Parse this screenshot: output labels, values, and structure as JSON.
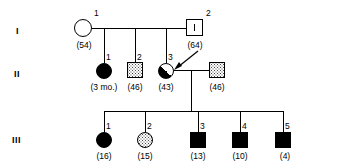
{
  "figure": {
    "type": "pedigree-chart",
    "title": "",
    "generation_labels": [
      "I",
      "II",
      "III"
    ],
    "symbol_colors": {
      "stroke": "#000000",
      "affected_fill": "#000000",
      "unaffected_fill": "#ffffff",
      "carrier_fill": "#4a4a4a"
    }
  },
  "generations": [
    {
      "label": "I",
      "individuals": [
        {
          "id": "I-1",
          "number": "1",
          "age_label": "(54)",
          "sex": "female",
          "shape": "circle",
          "status": "unaffected",
          "fill": "open"
        },
        {
          "id": "I-2",
          "number": "2",
          "age_label": "(64)",
          "sex": "male",
          "shape": "square",
          "status": "carrier-mark",
          "fill": "open",
          "inner_mark": "vertical-tick"
        }
      ]
    },
    {
      "label": "II",
      "individuals": [
        {
          "id": "II-1",
          "number": "1",
          "age_label": "(3 mo.)",
          "sex": "female",
          "shape": "circle",
          "status": "affected",
          "fill": "solid"
        },
        {
          "id": "II-2",
          "number": "2",
          "age_label": "(46)",
          "sex": "male",
          "shape": "square",
          "status": "carrier",
          "fill": "stipple"
        },
        {
          "id": "II-3",
          "number": "3",
          "age_label": "(43)",
          "sex": "female",
          "shape": "circle",
          "status": "affected-partial",
          "fill": "half-diagonal",
          "proband": true
        },
        {
          "id": "II-4",
          "number": "",
          "age_label": "(46)",
          "sex": "male",
          "shape": "square",
          "status": "carrier",
          "fill": "stipple"
        }
      ]
    },
    {
      "label": "III",
      "individuals": [
        {
          "id": "III-1",
          "number": "1",
          "age_label": "(16)",
          "sex": "female",
          "shape": "circle",
          "status": "affected",
          "fill": "solid"
        },
        {
          "id": "III-2",
          "number": "2",
          "age_label": "(15)",
          "sex": "female",
          "shape": "circle",
          "status": "carrier",
          "fill": "stipple"
        },
        {
          "id": "III-3",
          "number": "3",
          "age_label": "(13)",
          "sex": "male",
          "shape": "square",
          "status": "affected",
          "fill": "solid"
        },
        {
          "id": "III-4",
          "number": "4",
          "age_label": "(10)",
          "sex": "male",
          "shape": "square",
          "status": "affected",
          "fill": "solid"
        },
        {
          "id": "III-5",
          "number": "5",
          "age_label": "(4)",
          "sex": "male",
          "shape": "square",
          "status": "affected",
          "fill": "solid"
        }
      ]
    }
  ],
  "annotations": {
    "proband_arrow_target": "II-3"
  }
}
